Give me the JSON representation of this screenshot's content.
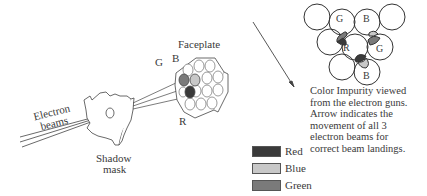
{
  "labels": {
    "faceplate": "Faceplate",
    "g": "G",
    "b": "B",
    "r": "R",
    "electron_beams_line1": "Electron",
    "electron_beams_line2": "beams",
    "shadow_mask_line1": "Shadow",
    "shadow_mask_line2": "mask"
  },
  "cluster_labels": {
    "g1": "G",
    "b1": "B",
    "r": "R",
    "g2": "G",
    "b2": "B"
  },
  "caption": [
    "Color Impurity viewed",
    "from the electron guns.",
    "Arrow indicates the",
    "movement of all 3",
    "electron beams for",
    "correct beam landings."
  ],
  "legend": [
    {
      "label": "Red",
      "color": "#3a3a3a"
    },
    {
      "label": "Blue",
      "color": "#c8c8c8"
    },
    {
      "label": "Green",
      "color": "#7a7a7a"
    }
  ]
}
